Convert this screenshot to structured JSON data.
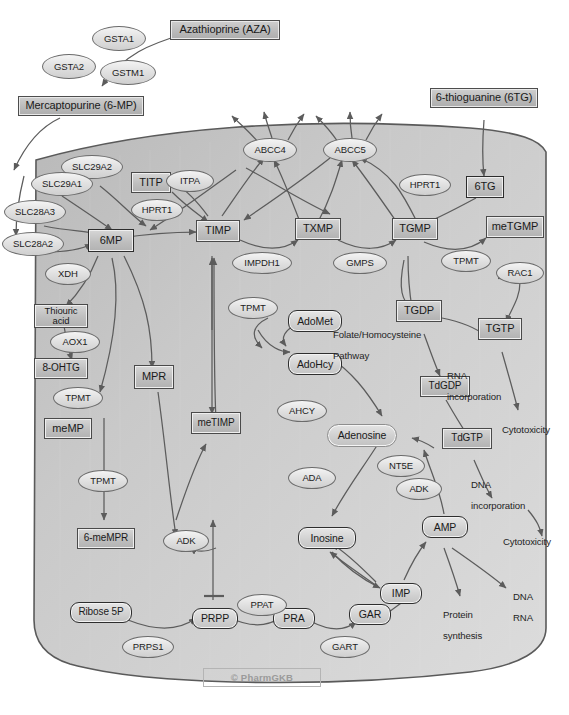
{
  "figure": {
    "watermark": "© PharmGKB",
    "caption": ""
  },
  "colors": {
    "cell_fill": "#c9c9c9",
    "cell_border": "#5a5a5a",
    "box_fill": "#c2c2c2",
    "box_border": "#4a4a4a",
    "ellipse_fill": "#e4e4e4",
    "ellipse_border": "#6b6b6b",
    "arrow": "#5c5c5c",
    "text": "#1a1a1a",
    "watermark": "#9a9a9a"
  },
  "drugs": [
    {
      "id": "aza",
      "label": "Azathioprine (AZA)"
    },
    {
      "id": "6mp_ext",
      "label": "Mercaptopurine (6-MP)"
    },
    {
      "id": "6tg_ext",
      "label": "6-thioguanine (6TG)"
    }
  ],
  "transporters": [
    {
      "id": "slc29a2",
      "label": "SLC29A2"
    },
    {
      "id": "slc29a1",
      "label": "SLC29A1"
    },
    {
      "id": "slc28a3",
      "label": "SLC28A3"
    },
    {
      "id": "slc28a2",
      "label": "SLC28A2"
    },
    {
      "id": "abcc4",
      "label": "ABCC4"
    },
    {
      "id": "abcc5",
      "label": "ABCC5"
    }
  ],
  "enzymes": [
    {
      "id": "gsta1",
      "label": "GSTA1"
    },
    {
      "id": "gsta2",
      "label": "GSTA2"
    },
    {
      "id": "gstm1",
      "label": "GSTM1"
    },
    {
      "id": "itpa",
      "label": "ITPA"
    },
    {
      "id": "hprt1_a",
      "label": "HPRT1"
    },
    {
      "id": "hprt1_b",
      "label": "HPRT1"
    },
    {
      "id": "impdh1",
      "label": "IMPDH1"
    },
    {
      "id": "gmps",
      "label": "GMPS"
    },
    {
      "id": "tpmt_tgmp",
      "label": "TPMT"
    },
    {
      "id": "rac1",
      "label": "RAC1"
    },
    {
      "id": "xdh",
      "label": "XDH"
    },
    {
      "id": "aox1",
      "label": "AOX1"
    },
    {
      "id": "tpmt_ohtg",
      "label": "TPMT"
    },
    {
      "id": "tpmt_memp",
      "label": "TPMT"
    },
    {
      "id": "tpmt_timp",
      "label": "TPMT"
    },
    {
      "id": "ahcy",
      "label": "AHCY"
    },
    {
      "id": "ada",
      "label": "ADA"
    },
    {
      "id": "nt5e",
      "label": "NT5E"
    },
    {
      "id": "adk_ade",
      "label": "ADK"
    },
    {
      "id": "adk_mpr",
      "label": "ADK"
    },
    {
      "id": "ppat",
      "label": "PPAT"
    },
    {
      "id": "prps1",
      "label": "PRPS1"
    },
    {
      "id": "gart",
      "label": "GART"
    }
  ],
  "metabolites": [
    {
      "id": "titp",
      "label": "TITP"
    },
    {
      "id": "6mp",
      "label": "6MP"
    },
    {
      "id": "timp",
      "label": "TIMP"
    },
    {
      "id": "txmp",
      "label": "TXMP"
    },
    {
      "id": "tgmp",
      "label": "TGMP"
    },
    {
      "id": "metgmp",
      "label": "meTGMP"
    },
    {
      "id": "6tg",
      "label": "6TG"
    },
    {
      "id": "thiouric",
      "label": "Thiouric acid"
    },
    {
      "id": "8ohtg",
      "label": "8-OHTG"
    },
    {
      "id": "memp",
      "label": "meMP"
    },
    {
      "id": "mpr",
      "label": "MPR"
    },
    {
      "id": "metimp",
      "label": "meTIMP"
    },
    {
      "id": "6memrp",
      "label": "6-meMPR"
    },
    {
      "id": "tgdp",
      "label": "TGDP"
    },
    {
      "id": "tgtp",
      "label": "TGTP"
    },
    {
      "id": "tdgdp",
      "label": "TdGDP"
    },
    {
      "id": "tdgtp",
      "label": "TdGTP"
    },
    {
      "id": "admet",
      "label": "AdoMet"
    },
    {
      "id": "adohcy",
      "label": "AdoHcy"
    },
    {
      "id": "adenosine",
      "label": "Adenosine"
    },
    {
      "id": "inosine",
      "label": "Inosine"
    },
    {
      "id": "amp",
      "label": "AMP"
    },
    {
      "id": "imp",
      "label": "IMP"
    },
    {
      "id": "ribose5p",
      "label": "Ribose 5P"
    },
    {
      "id": "prpp",
      "label": "PRPP"
    },
    {
      "id": "pra",
      "label": "PRA"
    },
    {
      "id": "gar",
      "label": "GAR"
    }
  ],
  "annotations": [
    {
      "id": "folate",
      "line1": "Folate/Homocysteine",
      "line2": "Pathway"
    },
    {
      "id": "rna_inc",
      "line1": "RNA",
      "line2": "incorporation"
    },
    {
      "id": "cytotox1",
      "line1": "Cytotoxicity",
      "line2": ""
    },
    {
      "id": "dna_inc",
      "line1": "DNA",
      "line2": "incorporation"
    },
    {
      "id": "cytotox2",
      "line1": "Cytotoxicity",
      "line2": ""
    },
    {
      "id": "protein",
      "line1": "Protein",
      "line2": "synthesis"
    },
    {
      "id": "dnarna",
      "line1": "DNA",
      "line2": "RNA"
    }
  ]
}
